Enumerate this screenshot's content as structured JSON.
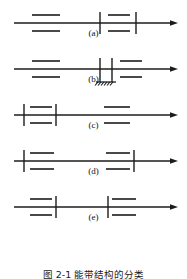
{
  "figure": {
    "caption": "图 2-1  能带结构的分类",
    "stroke_color": "#1c1c1c",
    "background_color": "#ffffff",
    "width": 187,
    "height": 279
  },
  "panels": [
    {
      "id": "a",
      "label": "(a)",
      "axis": {
        "y": 23,
        "x_start": 14,
        "x_end": 178,
        "arrow": "right"
      },
      "ticks": [
        {
          "x": 100,
          "half_height": 11
        },
        {
          "x": 136,
          "half_height": 11
        }
      ],
      "levels": [
        {
          "x1": 32,
          "x2": 60,
          "y": 15
        },
        {
          "x1": 32,
          "x2": 60,
          "y": 31
        },
        {
          "x1": 108,
          "x2": 130,
          "y": 15
        },
        {
          "x1": 108,
          "x2": 130,
          "y": 31
        }
      ],
      "ground": null
    },
    {
      "id": "b",
      "label": "(b)",
      "axis": {
        "y": 23,
        "x_start": 14,
        "x_end": 178,
        "arrow": "right"
      },
      "ticks": [
        {
          "x": 100,
          "half_height": 11
        },
        {
          "x": 112,
          "half_height": 11
        }
      ],
      "levels": [
        {
          "x1": 32,
          "x2": 60,
          "y": 15
        },
        {
          "x1": 32,
          "x2": 60,
          "y": 31
        },
        {
          "x1": 120,
          "x2": 142,
          "y": 15
        },
        {
          "x1": 120,
          "x2": 142,
          "y": 31
        }
      ],
      "ground": {
        "x_center": 106,
        "y": 36,
        "width": 20,
        "hatch_count": 6
      }
    },
    {
      "id": "c",
      "label": "(c)",
      "axis": {
        "y": 23,
        "x_start": 14,
        "x_end": 178,
        "arrow": "right"
      },
      "ticks": [
        {
          "x": 24,
          "half_height": 11
        },
        {
          "x": 56,
          "half_height": 11
        }
      ],
      "levels": [
        {
          "x1": 30,
          "x2": 52,
          "y": 15
        },
        {
          "x1": 30,
          "x2": 52,
          "y": 31
        },
        {
          "x1": 104,
          "x2": 130,
          "y": 15
        },
        {
          "x1": 104,
          "x2": 130,
          "y": 31
        }
      ],
      "ground": null
    },
    {
      "id": "d",
      "label": "(d)",
      "axis": {
        "y": 23,
        "x_start": 14,
        "x_end": 178,
        "arrow": "right"
      },
      "ticks": [
        {
          "x": 24,
          "half_height": 11
        },
        {
          "x": 134,
          "half_height": 11
        }
      ],
      "levels": [
        {
          "x1": 30,
          "x2": 54,
          "y": 15
        },
        {
          "x1": 30,
          "x2": 54,
          "y": 31
        },
        {
          "x1": 106,
          "x2": 130,
          "y": 15
        },
        {
          "x1": 106,
          "x2": 130,
          "y": 31
        }
      ],
      "ground": null
    },
    {
      "id": "e",
      "label": "(e)",
      "axis": {
        "y": 23,
        "x_start": 14,
        "x_end": 178,
        "arrow": "right"
      },
      "ticks": [
        {
          "x": 56,
          "half_height": 11
        },
        {
          "x": 108,
          "half_height": 11
        }
      ],
      "levels": [
        {
          "x1": 30,
          "x2": 52,
          "y": 15
        },
        {
          "x1": 30,
          "x2": 52,
          "y": 31
        },
        {
          "x1": 112,
          "x2": 136,
          "y": 15
        },
        {
          "x1": 112,
          "x2": 136,
          "y": 31
        }
      ],
      "ground": null
    }
  ]
}
